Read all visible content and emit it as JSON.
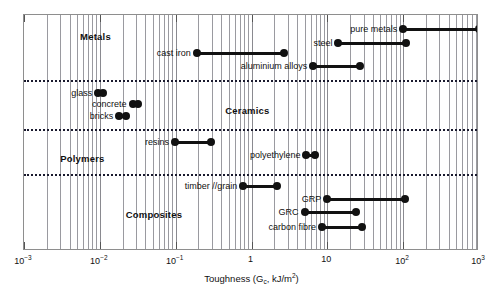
{
  "chart_data": {
    "type": "range-bar",
    "title": "",
    "xlabel": "Toughness (Gc, kJ/m2)",
    "xlabel_parts": {
      "prefix": "Toughness (G",
      "sub": "c",
      "mid": ", kJ/m",
      "sup": "2",
      "suffix": ")"
    },
    "xscale": "log",
    "xlim": [
      0.001,
      1000
    ],
    "xticks": [
      0.001,
      0.01,
      0.1,
      1,
      10,
      100,
      1000
    ],
    "xticklabels": [
      "10-3",
      "10-2",
      "10-1",
      "1",
      "10",
      "102",
      "103"
    ],
    "grid": "vertical-log-minor",
    "legend": "none",
    "groups": [
      {
        "name": "Metals",
        "label_x": 0.0055,
        "label_y": 30
      },
      {
        "name": "Ceramics",
        "label_x": 0.45,
        "label_y": 104
      },
      {
        "name": "Polymers",
        "label_x": 0.003,
        "label_y": 152
      },
      {
        "name": "Composites",
        "label_x": 0.022,
        "label_y": 208
      }
    ],
    "dividers_y": [
      79,
      128,
      173
    ],
    "series": [
      {
        "label": "pure metals",
        "min": 100,
        "max": 1000,
        "y": 28,
        "group": "Metals"
      },
      {
        "label": "steel",
        "min": 14,
        "max": 110,
        "y": 42,
        "group": "Metals"
      },
      {
        "label": "cast iron",
        "min": 0.19,
        "max": 2.7,
        "y": 52,
        "group": "Metals"
      },
      {
        "label": "aluminium alloys",
        "min": 6.5,
        "max": 27,
        "y": 65,
        "group": "Metals"
      },
      {
        "label": "glass",
        "min": 0.0095,
        "max": 0.011,
        "y": 92,
        "group": "Ceramics"
      },
      {
        "label": "concrete",
        "min": 0.027,
        "max": 0.032,
        "y": 103,
        "group": "Ceramics"
      },
      {
        "label": "bricks",
        "min": 0.018,
        "max": 0.022,
        "y": 115,
        "group": "Ceramics"
      },
      {
        "label": "resins",
        "min": 0.098,
        "max": 0.29,
        "y": 141,
        "group": "Polymers"
      },
      {
        "label": "polyethylene",
        "min": 5.3,
        "max": 6.8,
        "y": 154,
        "group": "Polymers"
      },
      {
        "label": "timber //grain",
        "min": 0.78,
        "max": 2.2,
        "y": 185,
        "group": "Composites"
      },
      {
        "label": "GRP",
        "min": 10,
        "max": 105,
        "y": 198,
        "group": "Composites"
      },
      {
        "label": "GRC",
        "min": 5.0,
        "max": 24,
        "y": 211,
        "group": "Composites"
      },
      {
        "label": "carbon fibre",
        "min": 8.5,
        "max": 29,
        "y": 226,
        "group": "Composites"
      }
    ]
  }
}
